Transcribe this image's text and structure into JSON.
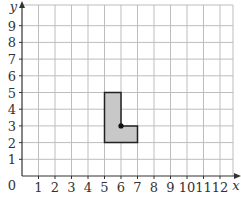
{
  "chart_data": {
    "type": "coordinate-grid",
    "xlabel": "x",
    "ylabel": "y",
    "origin_label": "0",
    "x_ticks": [
      "1",
      "2",
      "3",
      "4",
      "5",
      "6",
      "7",
      "8",
      "9",
      "10",
      "11",
      "12"
    ],
    "y_ticks": [
      "1",
      "2",
      "3",
      "4",
      "5",
      "6",
      "7",
      "8",
      "9"
    ],
    "xlim": [
      0,
      12.3
    ],
    "ylim": [
      0,
      9.9
    ],
    "grid": true,
    "shape": {
      "name": "L-shape",
      "vertices": [
        [
          5,
          2
        ],
        [
          7,
          2
        ],
        [
          7,
          3
        ],
        [
          6,
          3
        ],
        [
          6,
          5
        ],
        [
          5,
          5
        ]
      ],
      "fill": "#c8c8c8",
      "stroke": "#222222"
    },
    "point": {
      "x": 6,
      "y": 3
    }
  },
  "colors": {
    "grid": "#bdbdbd",
    "axis": "#333333",
    "shape_fill": "#c8c8c8",
    "shape_stroke": "#222222"
  }
}
